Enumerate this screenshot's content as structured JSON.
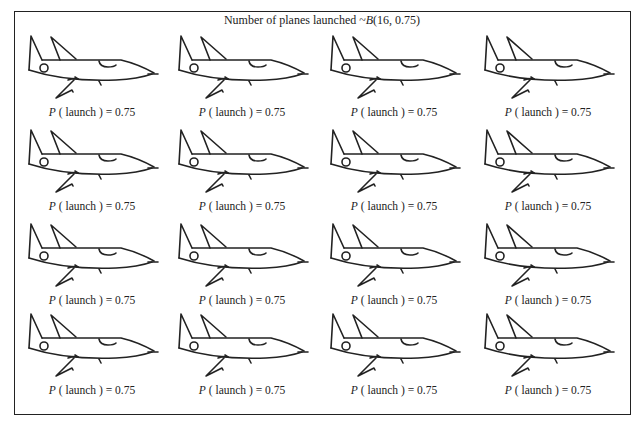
{
  "title": {
    "prefix": "Number of planes launched ~",
    "dist_symbol": "B",
    "params": "(16, 0.75)"
  },
  "planes": [
    {
      "row": 1,
      "col": 1,
      "x": 26,
      "y": 34,
      "label_p": "P",
      "label_rest": " ( launch ) = 0.75"
    },
    {
      "row": 1,
      "col": 2,
      "x": 176,
      "y": 34,
      "label_p": "P",
      "label_rest": " ( launch ) = 0.75"
    },
    {
      "row": 1,
      "col": 3,
      "x": 328,
      "y": 34,
      "label_p": "P",
      "label_rest": " ( launch ) = 0.75"
    },
    {
      "row": 1,
      "col": 4,
      "x": 482,
      "y": 34,
      "label_p": "P",
      "label_rest": " ( launch ) = 0.75"
    },
    {
      "row": 2,
      "col": 1,
      "x": 26,
      "y": 128,
      "label_p": "P",
      "label_rest": " ( launch ) = 0.75"
    },
    {
      "row": 2,
      "col": 2,
      "x": 176,
      "y": 128,
      "label_p": "P",
      "label_rest": " ( launch ) = 0.75"
    },
    {
      "row": 2,
      "col": 3,
      "x": 328,
      "y": 128,
      "label_p": "P",
      "label_rest": " ( launch ) = 0.75"
    },
    {
      "row": 2,
      "col": 4,
      "x": 482,
      "y": 128,
      "label_p": "P",
      "label_rest": " ( launch ) = 0.75"
    },
    {
      "row": 3,
      "col": 1,
      "x": 26,
      "y": 222,
      "label_p": "P",
      "label_rest": " ( launch ) = 0.75"
    },
    {
      "row": 3,
      "col": 2,
      "x": 176,
      "y": 222,
      "label_p": "P",
      "label_rest": " ( launch ) = 0.75"
    },
    {
      "row": 3,
      "col": 3,
      "x": 328,
      "y": 222,
      "label_p": "P",
      "label_rest": " ( launch ) = 0.75"
    },
    {
      "row": 3,
      "col": 4,
      "x": 482,
      "y": 222,
      "label_p": "P",
      "label_rest": " ( launch ) = 0.75"
    },
    {
      "row": 4,
      "col": 1,
      "x": 26,
      "y": 312,
      "label_p": "P",
      "label_rest": " ( launch ) = 0.75"
    },
    {
      "row": 4,
      "col": 2,
      "x": 176,
      "y": 312,
      "label_p": "P",
      "label_rest": " ( launch ) = 0.75"
    },
    {
      "row": 4,
      "col": 3,
      "x": 328,
      "y": 312,
      "label_p": "P",
      "label_rest": " ( launch ) = 0.75"
    },
    {
      "row": 4,
      "col": 4,
      "x": 482,
      "y": 312,
      "label_p": "P",
      "label_rest": " ( launch ) = 0.75"
    }
  ],
  "colors": {
    "stroke": "#222222",
    "background": "#ffffff"
  }
}
